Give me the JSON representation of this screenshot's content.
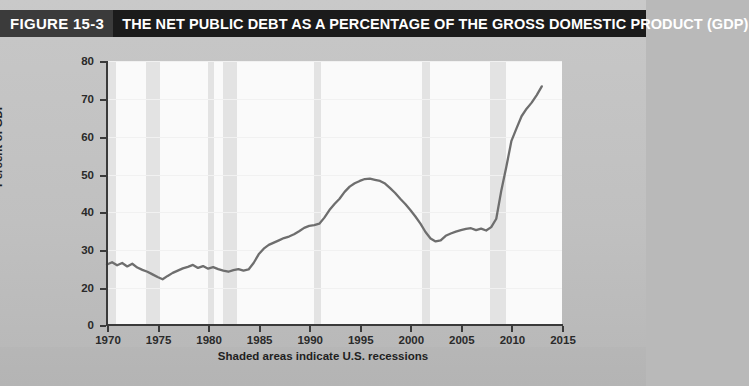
{
  "figure": {
    "number_label": "FIGURE 15-3",
    "title": "THE NET PUBLIC DEBT AS A PERCENTAGE OF THE GROSS DOMESTIC PRODUCT (GDP)",
    "caption": "Shaded areas indicate U.S. recessions",
    "title_bar_color": "#1b1b1b",
    "number_box_color": "#3b3b3b",
    "panel_color": "#c2c2c2",
    "plot_color": "#fafafa",
    "band_color": "#e3e3e3",
    "line_color": "#6e6e6e"
  },
  "chart_data": {
    "type": "line",
    "title": "THE NET PUBLIC DEBT AS A PERCENTAGE OF THE GROSS DOMESTIC PRODUCT (GDP)",
    "xlabel": "",
    "ylabel": "Percent of GDP",
    "xlim": [
      1970,
      2015
    ],
    "ylim": [
      0,
      80
    ],
    "y_axis_break_between": [
      0,
      20
    ],
    "grid": true,
    "legend": null,
    "x_ticks": [
      1970,
      1975,
      1980,
      1985,
      1990,
      1995,
      2000,
      2005,
      2010,
      2015
    ],
    "y_ticks": [
      0,
      20,
      30,
      40,
      50,
      60,
      70,
      80
    ],
    "series": [
      {
        "name": "Net public debt as a percentage of GDP",
        "color": "#6e6e6e",
        "x": [
          1970.0,
          1970.5,
          1971.0,
          1971.5,
          1972.0,
          1972.5,
          1973.0,
          1973.5,
          1974.0,
          1974.5,
          1975.0,
          1975.5,
          1976.0,
          1976.5,
          1977.0,
          1977.5,
          1978.0,
          1978.5,
          1979.0,
          1979.5,
          1980.0,
          1980.5,
          1981.0,
          1981.5,
          1982.0,
          1982.5,
          1983.0,
          1983.5,
          1984.0,
          1984.5,
          1985.0,
          1985.5,
          1986.0,
          1986.5,
          1987.0,
          1987.5,
          1988.0,
          1988.5,
          1989.0,
          1989.5,
          1990.0,
          1990.5,
          1991.0,
          1991.5,
          1992.0,
          1992.5,
          1993.0,
          1993.5,
          1994.0,
          1994.5,
          1995.0,
          1995.5,
          1996.0,
          1996.5,
          1997.0,
          1997.5,
          1998.0,
          1998.5,
          1999.0,
          1999.5,
          2000.0,
          2000.5,
          2001.0,
          2001.5,
          2002.0,
          2002.5,
          2003.0,
          2003.5,
          2004.0,
          2004.5,
          2005.0,
          2005.5,
          2006.0,
          2006.5,
          2007.0,
          2007.5,
          2008.0,
          2008.5,
          2009.0,
          2009.5,
          2010.0,
          2010.5,
          2011.0,
          2011.5,
          2012.0,
          2012.5,
          2013.0
        ],
        "y": [
          26.2,
          26.8,
          26.0,
          26.6,
          25.7,
          26.4,
          25.4,
          24.8,
          24.3,
          23.6,
          22.9,
          22.3,
          23.2,
          24.0,
          24.6,
          25.2,
          25.6,
          26.1,
          25.3,
          25.8,
          25.1,
          25.5,
          25.0,
          24.6,
          24.3,
          24.7,
          25.0,
          24.6,
          24.9,
          26.6,
          28.9,
          30.4,
          31.4,
          32.0,
          32.6,
          33.2,
          33.6,
          34.2,
          35.0,
          35.9,
          36.4,
          36.6,
          37.0,
          38.6,
          40.6,
          42.2,
          43.6,
          45.4,
          46.8,
          47.7,
          48.3,
          48.8,
          48.9,
          48.6,
          48.3,
          47.6,
          46.4,
          45.1,
          43.6,
          42.2,
          40.6,
          38.9,
          37.0,
          34.8,
          33.1,
          32.3,
          32.6,
          33.8,
          34.4,
          34.9,
          35.3,
          35.6,
          35.8,
          35.3,
          35.7,
          35.2,
          36.1,
          38.3,
          45.8,
          52.1,
          58.9,
          62.2,
          65.4,
          67.4,
          69.0,
          71.0,
          73.3
        ]
      }
    ],
    "recession_bands": [
      {
        "start": 1969.95,
        "end": 1970.9
      },
      {
        "start": 1973.85,
        "end": 1975.2
      },
      {
        "start": 1980.0,
        "end": 1980.55
      },
      {
        "start": 1981.5,
        "end": 1982.9
      },
      {
        "start": 1990.5,
        "end": 1991.2
      },
      {
        "start": 2001.2,
        "end": 2001.9
      },
      {
        "start": 2007.9,
        "end": 2009.5
      }
    ]
  }
}
